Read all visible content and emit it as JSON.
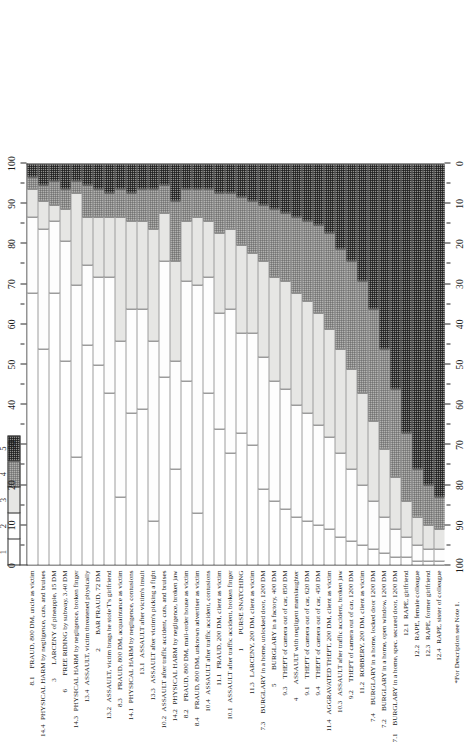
{
  "figure": {
    "note": "*For Description see Note 1.",
    "axis_top_label": "",
    "axis_bottom_label": ""
  },
  "legend": {
    "title": "",
    "entries": [
      {
        "key": "1",
        "label": "1",
        "swatch": "s1"
      },
      {
        "key": "2",
        "label": "2",
        "swatch": "s2"
      },
      {
        "key": "3",
        "label": "3",
        "swatch": "s3"
      },
      {
        "key": "4",
        "label": "4",
        "swatch": "s4"
      },
      {
        "key": "5",
        "label": "5",
        "swatch": "s5"
      }
    ]
  },
  "axes": {
    "primary_ticks": [
      "0",
      "10",
      "20",
      "30",
      "40",
      "50",
      "60",
      "70",
      "80",
      "90",
      "100"
    ],
    "secondary_ticks": [
      "100",
      "90",
      "80",
      "70",
      "60",
      "50",
      "40",
      "30",
      "20",
      "10",
      "0"
    ],
    "range": [
      0,
      100
    ],
    "minor_step": 5
  },
  "chart_data": {
    "type": "bar",
    "subtype": "stacked-100-percent-horizontal",
    "title": "",
    "xlabel": "",
    "ylabel": "",
    "xlim": [
      0,
      100
    ],
    "grid": false,
    "legend_position": "top-left",
    "series": [
      {
        "name": "1",
        "swatch": "s1"
      },
      {
        "name": "2",
        "swatch": "s2"
      },
      {
        "name": "3",
        "swatch": "s3"
      },
      {
        "name": "4",
        "swatch": "s4"
      },
      {
        "name": "5",
        "swatch": "s5"
      }
    ],
    "categories": [
      {
        "code": "8.1",
        "label": "FRAUD, 800 DM, uncle as victim",
        "values": [
          68,
          19,
          7,
          3,
          3
        ]
      },
      {
        "code": "14.4",
        "label": "PHYSICAL HARM by negligence, cuts, and bruises",
        "values": [
          54,
          30,
          7,
          4,
          5
        ]
      },
      {
        "code": "3",
        "label": "LARCENY of pineapple, 15 DM",
        "values": [
          68,
          18,
          4,
          6,
          4
        ]
      },
      {
        "code": "6",
        "label": "FREE RIDING by subway, 3.40 DM",
        "values": [
          51,
          30,
          8,
          5,
          6
        ]
      },
      {
        "code": "14.3",
        "label": "PHYSICAL HARM by negligence, broken finger",
        "values": [
          27,
          43,
          23,
          3,
          4
        ]
      },
      {
        "code": "13.4",
        "label": "ASSAULT, victim threatened physically",
        "values": [
          55,
          20,
          12,
          8,
          5
        ]
      },
      {
        "code": "2",
        "label": "BAR FRAUD, 72 DM",
        "values": [
          50,
          22,
          15,
          7,
          6
        ]
      },
      {
        "code": "13.2",
        "label": "ASSAULT, victim brags he stole T's girlfriend",
        "values": [
          43,
          29,
          15,
          6,
          7
        ]
      },
      {
        "code": "8.3",
        "label": "FRAUD, 800 DM, acquaintance as victim",
        "values": [
          17,
          39,
          31,
          7,
          6
        ]
      },
      {
        "code": "14.1",
        "label": "PHYSICAL HARM by negligence, contusions",
        "values": [
          38,
          26,
          22,
          7,
          7
        ]
      },
      {
        "code": "13.1",
        "label": "ASSAULT after victim's insult",
        "values": [
          39,
          25,
          22,
          8,
          6
        ]
      },
      {
        "code": "13.3",
        "label": "ASSAULT after victim's picking a fight",
        "values": [
          11,
          45,
          28,
          10,
          6
        ]
      },
      {
        "code": "10.2",
        "label": "ASSAULT after traffic accident, cuts, and bruises",
        "values": [
          47,
          29,
          12,
          7,
          5
        ]
      },
      {
        "code": "14.2",
        "label": "PHYSICAL HARM by negligence, broken jaw",
        "values": [
          24,
          27,
          25,
          15,
          9
        ]
      },
      {
        "code": "8.2",
        "label": "FRAUD, 800 DM, mail-order house as victim",
        "values": [
          46,
          25,
          15,
          8,
          6
        ]
      },
      {
        "code": "8.4",
        "label": "FRAUD, 800 DM, unknown advertiser as victim",
        "values": [
          13,
          57,
          17,
          7,
          6
        ]
      },
      {
        "code": "10.4",
        "label": "ASSAULT after traffic accident, contusions",
        "values": [
          43,
          29,
          14,
          8,
          6
        ]
      },
      {
        "code": "11.1",
        "label": "FRAUD, 200 DM, client as victim",
        "values": [
          34,
          29,
          20,
          10,
          7
        ]
      },
      {
        "code": "10.1",
        "label": "ASSAULT after traffic accident, broken finger",
        "values": [
          28,
          36,
          20,
          9,
          7
        ]
      },
      {
        "code": "1",
        "label": "PURSE SNATCHING",
        "values": [
          33,
          25,
          22,
          12,
          8
        ]
      },
      {
        "code": "11.3",
        "label": "LARCENY, 200 DM, client as victim",
        "values": [
          30,
          28,
          20,
          13,
          9
        ]
      },
      {
        "code": "7.3",
        "label": "BURGLARY in a home, unlocked door, 1200 DM",
        "values": [
          19,
          33,
          24,
          14,
          10
        ]
      },
      {
        "code": "5",
        "label": "BURGLARY in a factory, 400 DM",
        "values": [
          16,
          30,
          26,
          17,
          11
        ]
      },
      {
        "code": "9.3",
        "label": "THEFT of camera out of car, 850 DM",
        "values": [
          14,
          30,
          27,
          17,
          12
        ]
      },
      {
        "code": "4",
        "label": "ASSAULT with negligent manslaughter",
        "values": [
          12,
          28,
          28,
          19,
          13
        ]
      },
      {
        "code": "9.1",
        "label": "THEFT of camera out of car, 620 DM",
        "values": [
          11,
          27,
          28,
          20,
          14
        ]
      },
      {
        "code": "9.4",
        "label": "THEFT of camera out of car, 450 DM",
        "values": [
          10,
          25,
          28,
          22,
          15
        ]
      },
      {
        "code": "11.4",
        "label": "AGGRAVATED THEFT, 200 DM, client as victim",
        "values": [
          9,
          23,
          27,
          24,
          17
        ]
      },
      {
        "code": "10.3",
        "label": "ASSAULT after traffic accident, broken jaw",
        "values": [
          7,
          21,
          26,
          25,
          21
        ]
      },
      {
        "code": "9.2",
        "label": "THEFT of camera out of car, 1200 DM",
        "values": [
          6,
          18,
          25,
          27,
          24
        ]
      },
      {
        "code": "11.2",
        "label": "ROBBERY, 200 DM, client as victim",
        "values": [
          5,
          15,
          23,
          28,
          29
        ]
      },
      {
        "code": "7.4",
        "label": "BURGLARY in a home, locked door 1200 DM",
        "values": [
          4,
          12,
          20,
          28,
          36
        ]
      },
      {
        "code": "7.2",
        "label": "BURGLARY in a home, open window, 1200 DM",
        "values": [
          3,
          9,
          17,
          25,
          46
        ]
      },
      {
        "code": "7.1",
        "label": "BURGLARY in a home, spec. secured door, 1200 DM",
        "values": [
          2,
          7,
          13,
          22,
          56
        ]
      },
      {
        "code": "12.1",
        "label": "RAPE, girlfriend",
        "values": [
          2,
          5,
          9,
          17,
          67
        ]
      },
      {
        "code": "12.2",
        "label": "RAPE, female colleague",
        "values": [
          1,
          4,
          7,
          12,
          76
        ]
      },
      {
        "code": "12.3",
        "label": "RAPE, former girlfriend",
        "values": [
          1,
          3,
          6,
          10,
          80
        ]
      },
      {
        "code": "12.4",
        "label": "RAPE, sister of colleague",
        "values": [
          1,
          3,
          5,
          8,
          83
        ]
      }
    ]
  }
}
